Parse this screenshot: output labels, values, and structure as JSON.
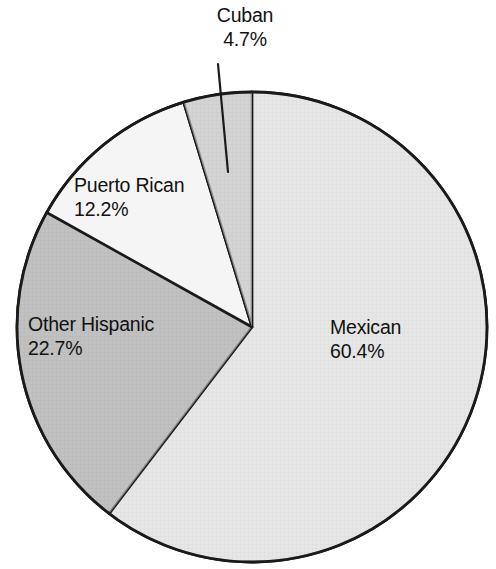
{
  "chart_data": {
    "type": "pie",
    "title": "",
    "subtitle": "",
    "xlabel": "",
    "ylabel": "",
    "legend_position": "none",
    "grid": false,
    "units": "percent",
    "categories": [
      "Mexican",
      "Other Hispanic",
      "Puerto Rican",
      "Cuban"
    ],
    "values": [
      60.4,
      22.7,
      12.2,
      4.7
    ],
    "slices": [
      {
        "label": "Mexican",
        "value": 60.4,
        "value_text": "60.4%",
        "color": "#c9c9c9",
        "start_angle_deg": 0,
        "end_angle_deg": 217.44,
        "label_position": "inside-right"
      },
      {
        "label": "Other Hispanic",
        "value": 22.7,
        "value_text": "22.7%",
        "color": "#8e8e8e",
        "start_angle_deg": 217.44,
        "end_angle_deg": 299.16,
        "label_position": "inside-left"
      },
      {
        "label": "Puerto Rican",
        "value": 12.2,
        "value_text": "12.2%",
        "color": "#f5f5f5",
        "start_angle_deg": 299.16,
        "end_angle_deg": 343.08,
        "label_position": "inside-upper-left"
      },
      {
        "label": "Cuban",
        "value": 4.7,
        "value_text": "4.7%",
        "color": "#a9a9a9",
        "start_angle_deg": 343.08,
        "end_angle_deg": 360,
        "label_position": "outside-top-with-leader"
      }
    ],
    "annotations": [
      {
        "name": "cuban-leader-line",
        "for": "Cuban",
        "from": [
          218,
          64
        ],
        "to": [
          228,
          172
        ]
      }
    ]
  },
  "labels": {
    "mexican": {
      "name": "Mexican",
      "value": "60.4%"
    },
    "other_hispanic": {
      "name": "Other Hispanic",
      "value": "22.7%"
    },
    "puerto_rican": {
      "name": "Puerto Rican",
      "value": "12.2%"
    },
    "cuban": {
      "name": "Cuban",
      "value": "4.7%"
    }
  },
  "style": {
    "background": "#ffffff",
    "outline_color": "#1a1a1a",
    "text_color": "#111111"
  }
}
